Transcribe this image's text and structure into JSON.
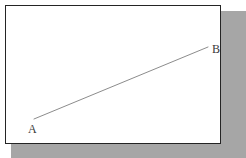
{
  "figure": {
    "type": "line-segment-diagram",
    "title": "",
    "background_color": "#ffffff",
    "frame": {
      "border_color": "#242424",
      "shadow_color": "#a6a6a6",
      "fill_color": "#ffffff"
    },
    "segment": {
      "name": "segment-ab",
      "color": "#8c8c8c",
      "stroke_width": 1,
      "start": {
        "label": "A",
        "x": 29,
        "y": 114
      },
      "end": {
        "label": "B",
        "x": 203,
        "y": 42
      }
    },
    "labels": [
      {
        "name": "point-a-label",
        "text": "A"
      },
      {
        "name": "point-b-label",
        "text": "B"
      }
    ]
  }
}
